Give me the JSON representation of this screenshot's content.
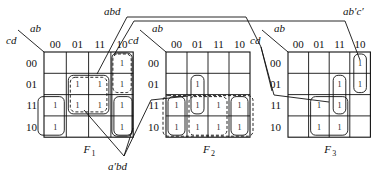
{
  "maps": [
    {
      "id": "F1",
      "name": "F",
      "sub": "1",
      "corner_row_var": "cd",
      "corner_col_var": "ab",
      "col_labels": [
        "00",
        "01",
        "11",
        "10"
      ],
      "row_labels": [
        "00",
        "01",
        "11",
        "10"
      ],
      "cells": [
        [
          "",
          "",
          "",
          "1"
        ],
        [
          "",
          "1",
          "1",
          "1"
        ],
        [
          "1",
          "1",
          "1",
          "1"
        ],
        [
          "1",
          "",
          "",
          "1"
        ]
      ],
      "origin": {
        "x": 44,
        "y": 52
      },
      "cell_w": 22.3,
      "cell_h": 21.3
    },
    {
      "id": "F2",
      "name": "F",
      "sub": "2",
      "corner_row_var": "cd",
      "corner_col_var": "ab",
      "col_labels": [
        "00",
        "01",
        "11",
        "10"
      ],
      "row_labels": [
        "00",
        "01",
        "11",
        "10"
      ],
      "cells": [
        [
          "",
          "",
          "",
          ""
        ],
        [
          "",
          "1",
          "",
          ""
        ],
        [
          "1",
          "1",
          "1",
          "1"
        ],
        [
          "1",
          "1",
          "1",
          "1"
        ]
      ],
      "origin": {
        "x": 166,
        "y": 52
      },
      "cell_w": 21.0,
      "cell_h": 21.3
    },
    {
      "id": "F3",
      "name": "F",
      "sub": "3",
      "corner_row_var": "cd",
      "corner_col_var": "ab",
      "col_labels": [
        "00",
        "01",
        "11",
        "10"
      ],
      "row_labels": [
        "00",
        "01",
        "11",
        "10"
      ],
      "cells": [
        [
          "",
          "",
          "",
          "1"
        ],
        [
          "",
          "",
          "1",
          "1"
        ],
        [
          "",
          "1",
          "1",
          ""
        ],
        [
          "",
          "1",
          "1",
          ""
        ]
      ],
      "origin": {
        "x": 288,
        "y": 52
      },
      "cell_w": 20.6,
      "cell_h": 21.3
    }
  ],
  "annotations": {
    "abd": "abd",
    "ab_c_prime": "ab′c′",
    "a_prime_bd": "a′bd"
  },
  "colors": {
    "line": "#111111",
    "background": "#ffffff"
  }
}
